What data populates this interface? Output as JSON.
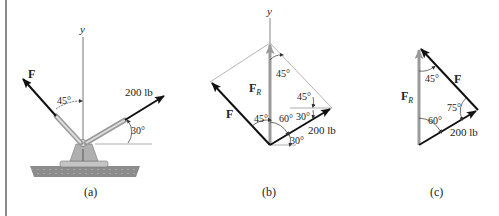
{
  "figure": {
    "panels": [
      {
        "id": "a",
        "caption": "(a)",
        "axis_label": "y",
        "force_label": "F",
        "load_label": "200 lb",
        "angle_f": "45°",
        "angle_load": "30°"
      },
      {
        "id": "b",
        "caption": "(b)",
        "axis_label": "y",
        "force_label": "F",
        "resultant_label": "F",
        "resultant_sub": "R",
        "load_label": "200 lb",
        "angles": [
          "45°",
          "45°",
          "60°",
          "45°",
          "30°",
          "30°"
        ]
      },
      {
        "id": "c",
        "caption": "(c)",
        "force_label": "F",
        "resultant_label": "F",
        "resultant_sub": "R",
        "load_label": "200 lb",
        "angles": [
          "45°",
          "75°",
          "60°"
        ]
      }
    ],
    "colors": {
      "vector": "#111111",
      "resultant": "#9a9a9a",
      "construction": "#b5b5b5",
      "ground": "#8c8c8c",
      "bracket": "#b0b0b0"
    }
  }
}
